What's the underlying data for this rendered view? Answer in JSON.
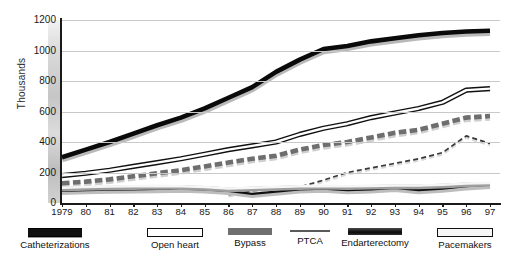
{
  "chart_data": {
    "type": "line",
    "title": "",
    "xlabel": "",
    "ylabel": "Thousands",
    "ylim": [
      0,
      1200
    ],
    "yticks": [
      0,
      200,
      400,
      600,
      800,
      1000,
      1200
    ],
    "grid": true,
    "legend_position": "bottom",
    "x": [
      "1979",
      "80",
      "81",
      "82",
      "83",
      "84",
      "85",
      "86",
      "87",
      "88",
      "89",
      "90",
      "91",
      "92",
      "93",
      "94",
      "95",
      "96",
      "97"
    ],
    "series": [
      {
        "name": "Catheterizations",
        "style": "thick-solid-black",
        "values": [
          300,
          350,
          400,
          455,
          510,
          560,
          620,
          690,
          760,
          860,
          940,
          1010,
          1030,
          1060,
          1080,
          1100,
          1115,
          1125,
          1130
        ]
      },
      {
        "name": "Open heart",
        "style": "outlined-white",
        "values": [
          180,
          195,
          215,
          240,
          265,
          290,
          320,
          350,
          375,
          400,
          450,
          490,
          520,
          560,
          590,
          620,
          660,
          740,
          750
        ]
      },
      {
        "name": "Bypass",
        "style": "thick-dashed-gray",
        "values": [
          130,
          140,
          155,
          175,
          195,
          215,
          240,
          265,
          290,
          310,
          350,
          380,
          400,
          430,
          460,
          480,
          520,
          560,
          570
        ]
      },
      {
        "name": "PTCA",
        "style": "thin-dashed",
        "values": [
          null,
          null,
          null,
          null,
          null,
          null,
          null,
          55,
          80,
          95,
          105,
          150,
          200,
          230,
          260,
          290,
          330,
          440,
          390
        ]
      },
      {
        "name": "Endarterectomy",
        "style": "solid-dark",
        "values": [
          80,
          85,
          88,
          90,
          92,
          95,
          90,
          80,
          60,
          75,
          90,
          95,
          85,
          90,
          100,
          85,
          95,
          110,
          120
        ]
      },
      {
        "name": "Pacemakers",
        "style": "outlined-gray",
        "values": [
          100,
          105,
          108,
          110,
          112,
          110,
          105,
          95,
          100,
          105,
          110,
          112,
          110,
          112,
          115,
          115,
          120,
          128,
          132
        ]
      }
    ]
  },
  "legend": {
    "items": [
      {
        "label": "Catheterizations",
        "swatch": "sw-cath"
      },
      {
        "label": "Open heart",
        "swatch": "sw-open"
      },
      {
        "label": "Bypass",
        "swatch": "sw-byp"
      },
      {
        "label": "PTCA",
        "swatch": "sw-ptca"
      },
      {
        "label": "Endarterectomy",
        "swatch": "sw-end"
      },
      {
        "label": "Pacemakers",
        "swatch": "sw-pace"
      }
    ]
  }
}
